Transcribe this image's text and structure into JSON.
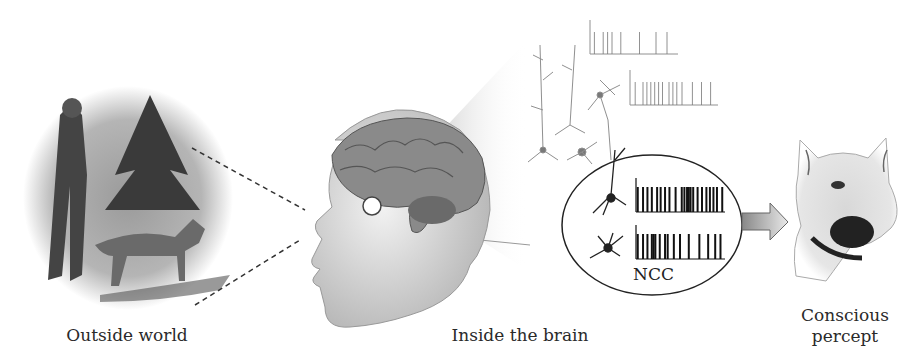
{
  "diagram": {
    "captions": {
      "outside_world": "Outside world",
      "inside_brain": "Inside the brain",
      "conscious_percept_line1": "Conscious",
      "conscious_percept_line2": "percept"
    },
    "ncc_label": "NCC",
    "panels": [
      {
        "id": "outside-world",
        "description": "Photo of man walking a German shepherd dog outdoors"
      },
      {
        "id": "head-brain",
        "description": "Head profile with visible brain and highlighted region"
      },
      {
        "id": "neurons",
        "description": "Neurons with spike trains; ellipse highlighting NCC neurons"
      },
      {
        "id": "percept",
        "description": "Close-up of German shepherd dog face"
      }
    ],
    "spike_trains": {
      "faint_top": [
        4,
        12,
        16,
        20,
        28,
        45,
        60,
        70
      ],
      "faint_second": [
        4,
        10,
        13,
        16,
        19,
        22,
        25,
        30,
        33,
        36,
        40,
        48,
        55,
        62
      ],
      "ncc_top": [
        2,
        8,
        13,
        18,
        24,
        28,
        33,
        38,
        45,
        52,
        55,
        58,
        60,
        62,
        65,
        70,
        75,
        80,
        84,
        88,
        92,
        98
      ],
      "ncc_bottom": [
        2,
        8,
        13,
        18,
        20,
        22,
        27,
        33,
        36,
        43,
        50,
        60,
        72,
        82,
        90,
        96
      ]
    },
    "colors": {
      "ink": "#222222",
      "arrow_fill": "#b8b8b8",
      "cone_fill": "#e6e6e6"
    }
  }
}
